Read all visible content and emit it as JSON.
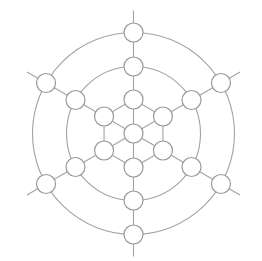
{
  "diagram": {
    "type": "radial hexagonal board",
    "center": [
      133.5,
      133.5
    ],
    "spoke_angles_deg": [
      90,
      30,
      -30,
      -90,
      -150,
      150
    ],
    "spoke_length": 123,
    "inner_hexagon_radius": 34,
    "ring_radii": [
      67,
      101
    ],
    "node_levels": [
      0,
      34,
      67,
      101
    ],
    "node_radius": 9.5,
    "node_count": 19,
    "colors": {
      "line": "#a3a3a3",
      "node_stroke": "#9a9a9a",
      "node_fill": "#ffffff",
      "background": "#ffffff"
    }
  }
}
